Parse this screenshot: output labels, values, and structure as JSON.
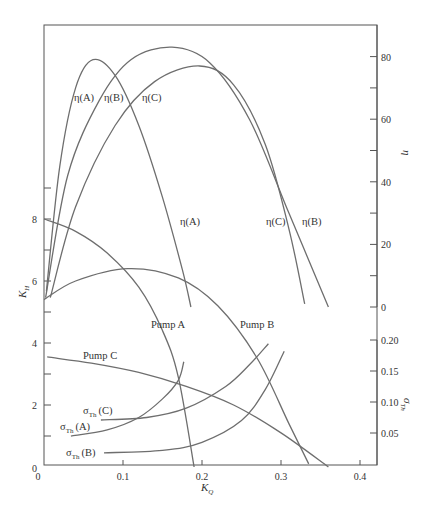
{
  "chart_data": {
    "type": "line",
    "title": "",
    "xlabel": "K_Q",
    "ylabel_left": "K_H",
    "ylabel_right_upper": "η",
    "ylabel_right_lower": "σ_Th",
    "xlim": [
      0,
      0.42
    ],
    "x_ticks": [
      0,
      0.1,
      0.2,
      0.3,
      0.4
    ],
    "x_tick_labels": [
      "0",
      "0.1",
      "0.2",
      "0.3",
      "0.4"
    ],
    "left_axis": {
      "label": "K_H",
      "range": [
        0,
        9
      ],
      "ticks": [
        0,
        1,
        2,
        3,
        4,
        5,
        6,
        7,
        8,
        9
      ],
      "tick_labels": {
        "2": "2",
        "4": "4",
        "6": "6",
        "8": "8"
      }
    },
    "right_upper_axis": {
      "label": "η",
      "range": [
        0,
        90
      ],
      "ticks": [
        0,
        10,
        20,
        30,
        40,
        50,
        60,
        70,
        80
      ],
      "tick_labels": {
        "0": "0",
        "20": "20",
        "40": "40",
        "60": "60",
        "80": "80"
      }
    },
    "right_lower_axis": {
      "label": "σ_Th",
      "range": [
        0.0,
        0.2
      ],
      "ticks": [
        0.05,
        0.1,
        0.15,
        0.2
      ],
      "tick_labels": [
        "0.05",
        "0.10",
        "0.15",
        "0.20"
      ]
    },
    "grid": false,
    "legend": "inline labels",
    "series": [
      {
        "name": "η(A)",
        "axis": "eta",
        "label_pos_top": [
          0.06,
          66
        ],
        "label_pos_bottom": [
          0.185,
          37
        ],
        "points": [
          [
            0.003,
            5
          ],
          [
            0.02,
            45
          ],
          [
            0.04,
            70
          ],
          [
            0.062,
            79
          ],
          [
            0.09,
            74
          ],
          [
            0.12,
            58
          ],
          [
            0.15,
            35
          ],
          [
            0.175,
            12
          ],
          [
            0.186,
            0
          ]
        ]
      },
      {
        "name": "η(B)",
        "axis": "eta",
        "label_pos_top": [
          0.085,
          66
        ],
        "label_pos_bottom": [
          0.34,
          37
        ],
        "points": [
          [
            0.002,
            3
          ],
          [
            0.03,
            42
          ],
          [
            0.07,
            66
          ],
          [
            0.11,
            79
          ],
          [
            0.162,
            83
          ],
          [
            0.21,
            78
          ],
          [
            0.26,
            60
          ],
          [
            0.31,
            30
          ],
          [
            0.36,
            0
          ]
        ]
      },
      {
        "name": "η(C)",
        "axis": "eta",
        "label_pos_top": [
          0.13,
          66
        ],
        "label_pos_bottom": [
          0.29,
          37
        ],
        "points": [
          [
            0.008,
            3
          ],
          [
            0.04,
            32
          ],
          [
            0.09,
            58
          ],
          [
            0.14,
            72
          ],
          [
            0.197,
            77
          ],
          [
            0.24,
            71
          ],
          [
            0.28,
            52
          ],
          [
            0.31,
            25
          ],
          [
            0.33,
            1
          ]
        ]
      },
      {
        "name": "Pump A",
        "axis": "K_H",
        "label_pos": [
          0.14,
          4.5
        ],
        "points": [
          [
            0.0,
            8.0
          ],
          [
            0.04,
            7.6
          ],
          [
            0.08,
            6.9
          ],
          [
            0.12,
            5.8
          ],
          [
            0.15,
            4.4
          ],
          [
            0.17,
            2.9
          ],
          [
            0.19,
            0
          ]
        ]
      },
      {
        "name": "Pump B",
        "axis": "K_H",
        "label_pos": [
          0.26,
          4.5
        ],
        "points": [
          [
            0.0,
            5.4
          ],
          [
            0.04,
            6.0
          ],
          [
            0.106,
            6.4
          ],
          [
            0.17,
            6.1
          ],
          [
            0.22,
            5.2
          ],
          [
            0.27,
            3.5
          ],
          [
            0.31,
            1.4
          ],
          [
            0.335,
            0.1
          ]
        ]
      },
      {
        "name": "Pump C",
        "axis": "K_H",
        "label_pos": [
          0.04,
          3.65
        ],
        "points": [
          [
            0.004,
            3.55
          ],
          [
            0.06,
            3.35
          ],
          [
            0.12,
            3.05
          ],
          [
            0.18,
            2.6
          ],
          [
            0.24,
            2.0
          ],
          [
            0.3,
            1.1
          ],
          [
            0.36,
            0
          ]
        ]
      },
      {
        "name": "σ_Th (A)",
        "axis": "sigma",
        "label_pos": [
          -0.02,
          0.055
        ],
        "points": [
          [
            0.034,
            0.045
          ],
          [
            0.08,
            0.055
          ],
          [
            0.12,
            0.075
          ],
          [
            0.15,
            0.105
          ],
          [
            0.17,
            0.135
          ],
          [
            0.177,
            0.165
          ]
        ]
      },
      {
        "name": "σ_Th (C)",
        "axis": "sigma",
        "label_pos": [
          0.03,
          0.08
        ],
        "points": [
          [
            0.072,
            0.071
          ],
          [
            0.13,
            0.075
          ],
          [
            0.18,
            0.09
          ],
          [
            0.23,
            0.125
          ],
          [
            0.26,
            0.16
          ],
          [
            0.284,
            0.194
          ]
        ]
      },
      {
        "name": "σ_Th (B)",
        "axis": "sigma",
        "label_pos": [
          0.03,
          0.02
        ],
        "points": [
          [
            0.076,
            0.018
          ],
          [
            0.15,
            0.022
          ],
          [
            0.2,
            0.035
          ],
          [
            0.25,
            0.07
          ],
          [
            0.28,
            0.12
          ],
          [
            0.304,
            0.182
          ]
        ]
      }
    ]
  },
  "labels": {
    "x_axis": "K",
    "x_axis_sub": "Q",
    "left_axis": "K",
    "left_axis_sub": "H",
    "right_upper_axis": "η",
    "right_lower_axis": "σ",
    "right_lower_axis_sub": "Th",
    "pump_a": "Pump A",
    "pump_b": "Pump B",
    "pump_c": "Pump C",
    "eta_a_top": "η(A)",
    "eta_b_top": "η(B)",
    "eta_c_top": "η(C)",
    "eta_a_bottom": "η(A)",
    "eta_c_bottom": "η(C)",
    "eta_b_bottom": "η(B)",
    "sigma_c": "(C)",
    "sigma_a": "(A)",
    "sigma_b": "(B)",
    "sigma": "σ",
    "th": "Th"
  }
}
